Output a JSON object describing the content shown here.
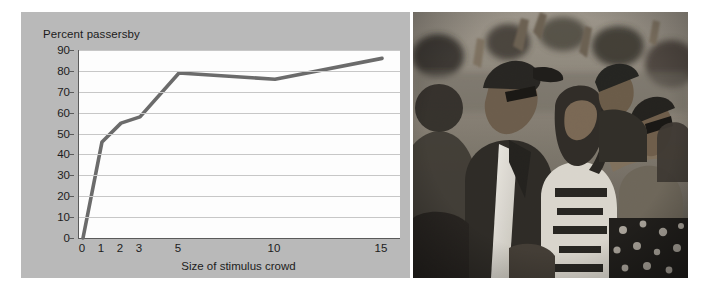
{
  "figure": {
    "background_color": "#ffffff",
    "panel_color": "#b9b9b9",
    "plot_background": "#fdfdfd",
    "line_color": "#6b6b6b",
    "axis_color": "#5a5a5a",
    "grid_color": "#c7c7c7"
  },
  "chart_data": {
    "type": "line",
    "title": "Percent passersby",
    "xlabel": "Size of stimulus crowd",
    "ylabel": "Percent passersby",
    "categories": [
      "0",
      "1",
      "2",
      "3",
      "5",
      "10",
      "15"
    ],
    "x": [
      0,
      1,
      2,
      3,
      5,
      10,
      15
    ],
    "values": [
      0,
      46,
      55,
      58,
      79,
      76,
      86
    ],
    "series": [
      {
        "name": "Percent passersby",
        "values": [
          0,
          46,
          55,
          58,
          79,
          76,
          86
        ]
      }
    ],
    "yticks": [
      0,
      10,
      20,
      30,
      40,
      50,
      60,
      70,
      80,
      90
    ],
    "ylim": [
      0,
      90
    ],
    "xtick_labels": [
      "0",
      "1",
      "2",
      "3",
      "5",
      "10",
      "15"
    ],
    "xtick_positions": [
      4,
      23,
      42,
      61,
      100,
      196,
      303
    ],
    "grid": true,
    "grid_axis": "y",
    "legend": false,
    "markers": false
  },
  "photo": {
    "alt": "crowd-of-people-looking-upward",
    "caption": ""
  }
}
